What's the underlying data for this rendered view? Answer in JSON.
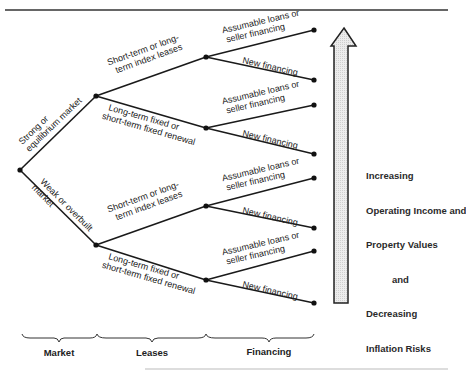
{
  "diagram": {
    "type": "decision-tree",
    "root": {
      "branches": [
        {
          "label_lines": [
            "Strong or",
            "equilibrium market"
          ],
          "children": [
            {
              "label_lines": [
                "Short-term or long-",
                "term index leases"
              ],
              "children": [
                {
                  "label_lines": [
                    "Assumable loans or",
                    "seller financing"
                  ]
                },
                {
                  "label_lines": [
                    "New financing"
                  ]
                }
              ]
            },
            {
              "label_lines": [
                "Long-term fixed or",
                "short-term fixed renewal"
              ],
              "children": [
                {
                  "label_lines": [
                    "Assumable loans or",
                    "seller financing"
                  ]
                },
                {
                  "label_lines": [
                    "New financing"
                  ]
                }
              ]
            }
          ]
        },
        {
          "label_lines": [
            "Weak or overbuilt",
            "market"
          ],
          "children": [
            {
              "label_lines": [
                "Short-term or long-",
                "term index leases"
              ],
              "children": [
                {
                  "label_lines": [
                    "Assumable loans or",
                    "seller financing"
                  ]
                },
                {
                  "label_lines": [
                    "New financing"
                  ]
                }
              ]
            },
            {
              "label_lines": [
                "Long-term fixed or",
                "short-term fixed renewal"
              ],
              "children": [
                {
                  "label_lines": [
                    "Assumable loans or",
                    "seller financing"
                  ]
                },
                {
                  "label_lines": [
                    "New financing"
                  ]
                }
              ]
            }
          ]
        }
      ]
    },
    "arrow_caption": [
      "Increasing",
      "Operating Income and",
      "Property Values",
      "and",
      "Decreasing",
      "Inflation Risks"
    ],
    "categories": [
      "Market",
      "Leases",
      "Financing"
    ],
    "colors": {
      "line": "#1a1a1a",
      "arrow_fill": "#e6e6e6",
      "text": "#222222"
    }
  }
}
